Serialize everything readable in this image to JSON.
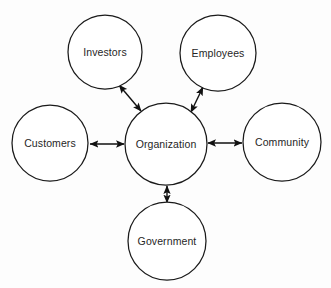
{
  "diagram": {
    "background_color": "#fdfdfd",
    "node_fill_color": "#ffffff",
    "node_stroke_color": "#1a1a1a",
    "text_color": "#262626",
    "arrow_color": "#111111",
    "center": {
      "id": "organization",
      "label": "Organization",
      "cx": 166,
      "cy": 144,
      "r": 41
    },
    "nodes": [
      {
        "id": "investors",
        "label": "Investors",
        "cx": 105,
        "cy": 52,
        "r": 37
      },
      {
        "id": "employees",
        "label": "Employees",
        "cx": 218,
        "cy": 53,
        "r": 38
      },
      {
        "id": "customers",
        "label": "Customers",
        "cx": 50,
        "cy": 143,
        "r": 38
      },
      {
        "id": "community",
        "label": "Community",
        "cx": 282,
        "cy": 142,
        "r": 39
      },
      {
        "id": "government",
        "label": "Government",
        "cx": 167,
        "cy": 241,
        "r": 39
      }
    ],
    "connectors": [
      {
        "id": "organization-investors",
        "from": "organization",
        "to": "investors",
        "type": "bidirectional",
        "x1": 141,
        "y1": 111,
        "x2": 119,
        "y2": 85
      },
      {
        "id": "organization-employees",
        "from": "organization",
        "to": "employees",
        "type": "bidirectional",
        "x1": 191,
        "y1": 112,
        "x2": 203,
        "y2": 87
      },
      {
        "id": "organization-customers",
        "from": "organization",
        "to": "customers",
        "type": "bidirectional",
        "x1": 124,
        "y1": 144,
        "x2": 90,
        "y2": 144
      },
      {
        "id": "organization-community",
        "from": "organization",
        "to": "community",
        "type": "bidirectional",
        "x1": 208,
        "y1": 143,
        "x2": 242,
        "y2": 143
      },
      {
        "id": "organization-government",
        "from": "organization",
        "to": "government",
        "type": "bidirectional",
        "x1": 167,
        "y1": 186,
        "x2": 167,
        "y2": 203
      }
    ]
  }
}
